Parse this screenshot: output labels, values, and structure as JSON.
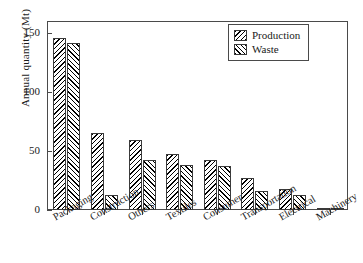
{
  "chart_data": {
    "type": "bar",
    "title": "",
    "xlabel": "",
    "ylabel": "Annual quantity (Mt)",
    "ylim": [
      0,
      160
    ],
    "yticks": [
      0,
      50,
      100,
      150
    ],
    "ytick_labels": [
      "0",
      "50",
      "100",
      "150"
    ],
    "grid": false,
    "legend_position": "upper right",
    "categories": [
      "Packaging",
      "Construction",
      "Others",
      "Textiles",
      "Consumer",
      "Transportation",
      "Electrical",
      "Machinery"
    ],
    "series": [
      {
        "name": "Production",
        "values": [
          146,
          65,
          59,
          47,
          42,
          27,
          18,
          2
        ]
      },
      {
        "name": "Waste",
        "values": [
          141,
          13,
          42,
          38,
          37,
          16,
          13,
          1
        ]
      }
    ]
  },
  "legend": {
    "items": [
      {
        "label": "Production",
        "pattern": "hatch-backslash"
      },
      {
        "label": "Waste",
        "pattern": "hatch-slash"
      }
    ]
  },
  "axes": {
    "y_title": "Annual quantity (Mt)"
  },
  "colors": {
    "bar_edge": "#3a3a3a",
    "bar_fill": "#ffffff",
    "hatch": "#000000",
    "frame": "#4a4a4a",
    "text": "#1a1a1a",
    "background": "#ffffff"
  }
}
